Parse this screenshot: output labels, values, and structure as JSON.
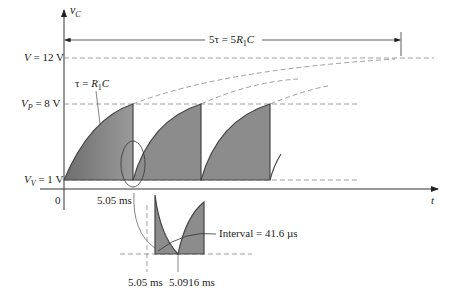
{
  "diagram": {
    "y_axis_label": "v",
    "y_axis_sub": "C",
    "x_axis_label": "t",
    "origin_label": "0",
    "levels": [
      {
        "name": "V",
        "sub": "",
        "text": " = 12 V",
        "value": 12
      },
      {
        "name": "V",
        "sub": "P",
        "text": " = 8 V",
        "value": 8
      },
      {
        "name": "V",
        "sub": "V",
        "text": " = 1 V",
        "value": 1
      }
    ],
    "time_constant_label": {
      "pre": "τ = ",
      "r": "R",
      "sub": "1",
      "post": "C"
    },
    "five_tau_label": {
      "pre": "5τ = 5",
      "r": "R",
      "sub": "1",
      "post": "C"
    },
    "first_discharge_time": "5.05 ms",
    "inset": {
      "start_time": "5.05 ms",
      "end_time": "5.0916 ms",
      "interval_label": "Interval = 41.6 µs"
    },
    "colors": {
      "fill": "#8c8c8c",
      "fill_dark": "#777777",
      "line": "#333333",
      "dash": "#888888"
    }
  }
}
